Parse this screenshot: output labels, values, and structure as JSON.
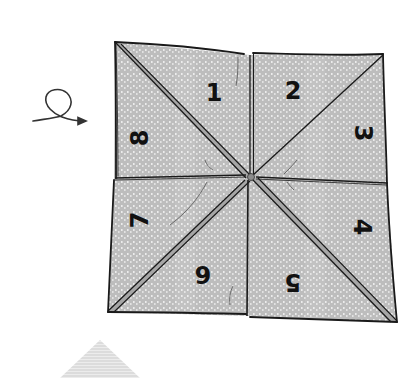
{
  "diagram": {
    "colors": {
      "background": "#ffffff",
      "paper": "#bdbdbd",
      "paper_dots": "#eeeeee",
      "ink": "#1a1a1a",
      "fold_highlight": "#9a9a9a",
      "next_step_triangle": "#d9d9d9"
    },
    "flap_numbers": [
      {
        "id": 1,
        "label": "1",
        "position": "top-left-upper",
        "rotation": 0
      },
      {
        "id": 2,
        "label": "2",
        "position": "top-right-upper",
        "rotation": 0
      },
      {
        "id": 3,
        "label": "3",
        "position": "right-upper",
        "rotation": 90
      },
      {
        "id": 4,
        "label": "4",
        "position": "right-lower",
        "rotation": 90
      },
      {
        "id": 5,
        "label": "5",
        "position": "bottom-right-lower",
        "rotation": 180
      },
      {
        "id": 6,
        "label": "6",
        "position": "bottom-left-lower",
        "rotation": 180
      },
      {
        "id": 7,
        "label": "7",
        "position": "left-lower",
        "rotation": -90
      },
      {
        "id": 8,
        "label": "8",
        "position": "left-upper",
        "rotation": -90
      }
    ],
    "instruction_icons": [
      {
        "name": "turn-over-loop-arrow",
        "meaning": "turn the paper over"
      }
    ],
    "next_step_preview": "partial gray triangle at bottom"
  }
}
